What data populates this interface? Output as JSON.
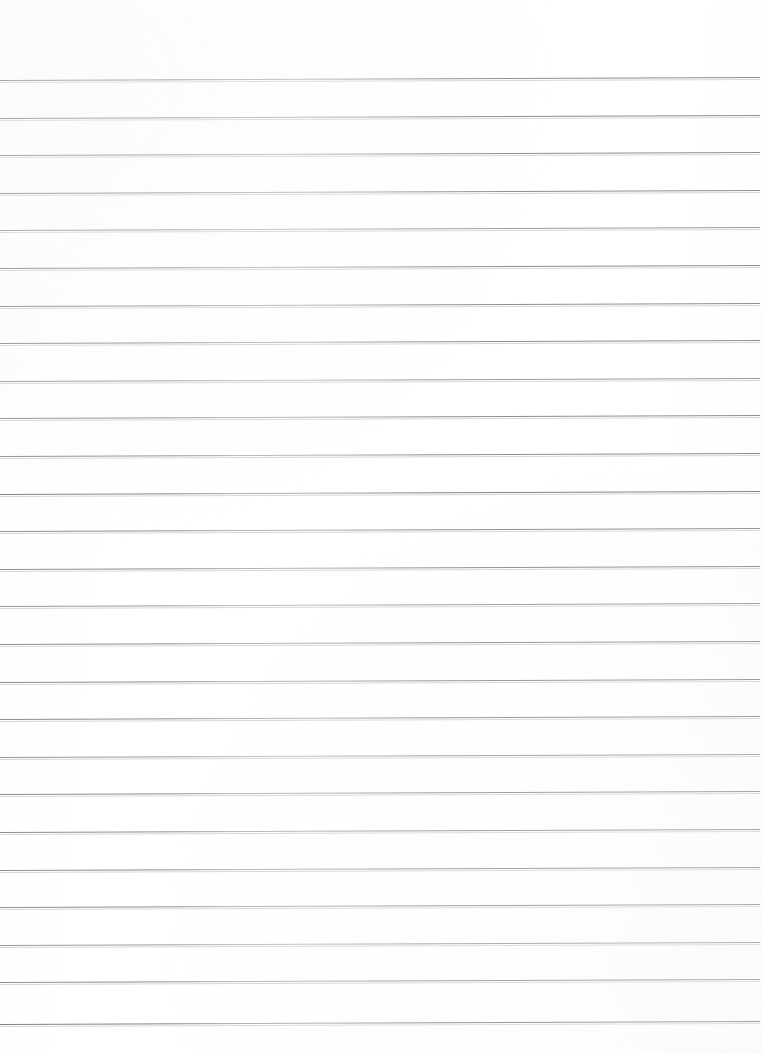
{
  "document": {
    "kind": "scanned-ruled-paper",
    "title": "",
    "body_text": "",
    "page_width": 763,
    "page_height": 1054,
    "background_color": "#ffffff",
    "has_text_content": false,
    "has_header": false,
    "has_footer": false,
    "has_margin_rule": false,
    "has_page_number": false
  },
  "ruling": {
    "line_color": "#8e8e90",
    "line_count": 26,
    "first_line_y": 80,
    "line_spacing": 37.6,
    "line_thickness": 1,
    "left_x": 0,
    "right_x": 760,
    "skew_degrees": -0.22,
    "lines": [
      {
        "index": 1,
        "y": 80,
        "weight": "normal"
      },
      {
        "index": 2,
        "y": 117.6,
        "weight": "normal"
      },
      {
        "index": 3,
        "y": 155.2,
        "weight": "normal"
      },
      {
        "index": 4,
        "y": 192.8,
        "weight": "normal"
      },
      {
        "index": 5,
        "y": 230.4,
        "weight": "faint"
      },
      {
        "index": 6,
        "y": 268,
        "weight": "normal"
      },
      {
        "index": 7,
        "y": 305.6,
        "weight": "normal"
      },
      {
        "index": 8,
        "y": 343.2,
        "weight": "normal"
      },
      {
        "index": 9,
        "y": 380.8,
        "weight": "faint"
      },
      {
        "index": 10,
        "y": 418.4,
        "weight": "normal"
      },
      {
        "index": 11,
        "y": 456,
        "weight": "normal"
      },
      {
        "index": 12,
        "y": 493.6,
        "weight": "strong"
      },
      {
        "index": 13,
        "y": 531.2,
        "weight": "normal"
      },
      {
        "index": 14,
        "y": 568.8,
        "weight": "normal"
      },
      {
        "index": 15,
        "y": 606.4,
        "weight": "faint"
      },
      {
        "index": 16,
        "y": 644,
        "weight": "normal"
      },
      {
        "index": 17,
        "y": 681.6,
        "weight": "normal"
      },
      {
        "index": 18,
        "y": 719.2,
        "weight": "normal"
      },
      {
        "index": 19,
        "y": 756.8,
        "weight": "faint"
      },
      {
        "index": 20,
        "y": 794.4,
        "weight": "normal"
      },
      {
        "index": 21,
        "y": 832,
        "weight": "normal"
      },
      {
        "index": 22,
        "y": 869.6,
        "weight": "normal"
      },
      {
        "index": 23,
        "y": 907.2,
        "weight": "normal"
      },
      {
        "index": 24,
        "y": 944.8,
        "weight": "faint"
      },
      {
        "index": 25,
        "y": 982.4,
        "weight": "normal"
      },
      {
        "index": 26,
        "y": 1024,
        "weight": "strong"
      }
    ]
  }
}
